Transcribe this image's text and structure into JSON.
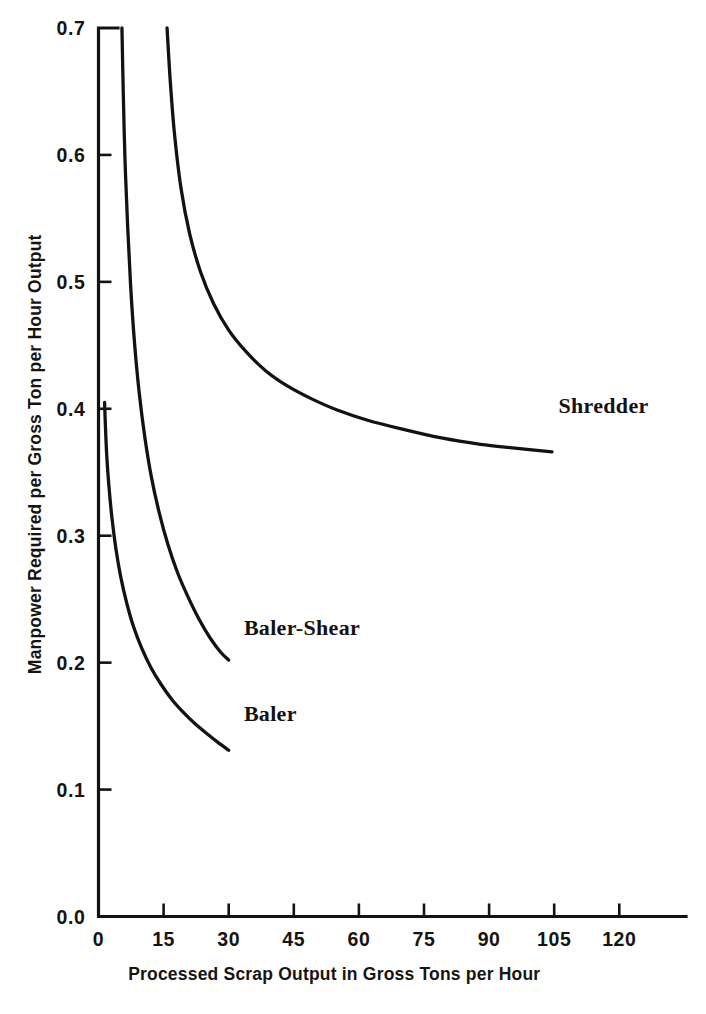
{
  "chart_data": {
    "type": "line",
    "title": "",
    "subtitle": "",
    "xlabel": "Processed Scrap Output in Gross Tons per Hour",
    "ylabel": "Manpower Required per Gross Ton per Hour Output",
    "xlim": [
      0,
      132
    ],
    "ylim": [
      0.0,
      0.7
    ],
    "grid": false,
    "legend_position": "inline-annotation",
    "x_ticks": [
      0,
      15,
      30,
      45,
      60,
      75,
      90,
      105,
      120
    ],
    "x_tick_labels": [
      "0",
      "15",
      "30",
      "45",
      "60",
      "75",
      "90",
      "105",
      "120"
    ],
    "y_ticks": [
      0.0,
      0.1,
      0.2,
      0.3,
      0.4,
      0.5,
      0.6,
      0.7
    ],
    "y_tick_labels": [
      "0.0",
      "0.1",
      "0.2",
      "0.3",
      "0.4",
      "0.5",
      "0.6",
      "0.7"
    ],
    "series": [
      {
        "name": "Shredder",
        "label": "Shredder",
        "label_x": 106,
        "label_y": 0.397,
        "x": [
          15.8,
          16.5,
          17.5,
          19.0,
          21.0,
          23.5,
          26.5,
          30.0,
          34.0,
          38.5,
          43.5,
          49.0,
          55.0,
          62.0,
          70.0,
          79.0,
          88.0,
          96.0,
          104.5
        ],
        "y": [
          0.7,
          0.66,
          0.617,
          0.574,
          0.538,
          0.508,
          0.483,
          0.462,
          0.445,
          0.43,
          0.418,
          0.408,
          0.399,
          0.391,
          0.384,
          0.377,
          0.372,
          0.369,
          0.366
        ]
      },
      {
        "name": "Baler-Shear",
        "label": "Baler-Shear",
        "label_x": 33.5,
        "label_y": 0.222,
        "x": [
          5.4,
          5.7,
          6.1,
          6.7,
          7.4,
          8.3,
          9.4,
          10.7,
          12.2,
          14.0,
          16.0,
          18.2,
          20.6,
          23.2,
          25.8,
          28.2,
          30.0
        ],
        "y": [
          0.7,
          0.65,
          0.597,
          0.545,
          0.497,
          0.452,
          0.412,
          0.377,
          0.346,
          0.318,
          0.293,
          0.271,
          0.252,
          0.234,
          0.219,
          0.208,
          0.202
        ]
      },
      {
        "name": "Baler",
        "label": "Baler",
        "label_x": 33.5,
        "label_y": 0.154,
        "x": [
          1.4,
          1.6,
          1.9,
          2.4,
          3.1,
          4.0,
          5.1,
          6.5,
          8.1,
          10.0,
          12.1,
          14.4,
          16.9,
          19.5,
          22.2,
          25.0,
          27.6,
          30.0
        ],
        "y": [
          0.405,
          0.386,
          0.363,
          0.339,
          0.314,
          0.29,
          0.268,
          0.247,
          0.228,
          0.211,
          0.196,
          0.183,
          0.171,
          0.161,
          0.152,
          0.144,
          0.137,
          0.131
        ]
      }
    ]
  },
  "colors": {
    "curve": "#131210",
    "axis": "#15130f",
    "text": "#17140f",
    "background": "#ffffff"
  }
}
